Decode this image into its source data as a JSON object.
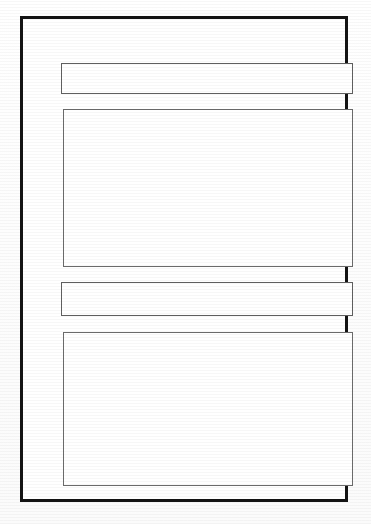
{
  "document": {
    "type": "blank-form-template",
    "orientation": "portrait",
    "background_color": "#fefefe",
    "frame": {
      "border_color": "#141414",
      "border_width_px": 3,
      "fill_color": "#ffffff"
    }
  },
  "fields": [
    {
      "id": "field-1",
      "shape": "narrow-rectangle",
      "label": "",
      "value": "",
      "placeholder": "",
      "border_color": "#5f5f5f"
    },
    {
      "id": "field-2",
      "shape": "tall-rectangle",
      "label": "",
      "value": "",
      "placeholder": "",
      "border_color": "#6b6b6b"
    },
    {
      "id": "field-3",
      "shape": "narrow-rectangle",
      "label": "",
      "value": "",
      "placeholder": "",
      "border_color": "#5f5f5f"
    },
    {
      "id": "field-4",
      "shape": "tall-rectangle",
      "label": "",
      "value": "",
      "placeholder": "",
      "border_color": "#6b6b6b"
    }
  ]
}
